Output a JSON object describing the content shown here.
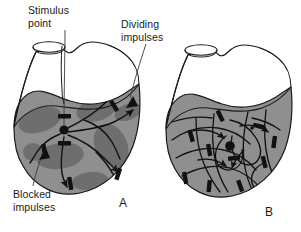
{
  "figure": {
    "background_color": "#ffffff"
  },
  "labels": {
    "stimulus_point": "Stimulus\npoint",
    "dividing_impulses": "Dividing\nimpulses",
    "blocked_impulses": "Blocked\nimpulses"
  },
  "captions": {
    "panel_a": "A",
    "panel_b": "B"
  },
  "colors": {
    "outline": "#1a1a1a",
    "atrium_fill": "#ffffff",
    "ventricle_fill": "#8f8f8f",
    "ischemic_patch_fill": "#6e6e6e",
    "impulse_path": "#1a1a1a",
    "block_bar": "#111111",
    "stimulus_dot": "#111111",
    "leader_line": "#3a3a3a"
  },
  "panels": [
    {
      "id": "A",
      "name": "panel-a-heart",
      "description": "Heart with patchy ischemic myocardium; a stimulus point gives rise to dividing impulses, several of which are blocked by areas of conduction block.",
      "stimulus_point": {
        "x": 64,
        "y": 131
      },
      "block_bar_count": 6,
      "impulse_arrow_count": 6,
      "ischemic_patch_count": 7
    },
    {
      "id": "B",
      "name": "panel-b-heart",
      "description": "Heart with diffusely damaged myocardium showing many tangled reentrant circuits and numerous conduction blocks.",
      "stimulus_point": {
        "x": 232,
        "y": 138
      },
      "block_bar_count": 10,
      "impulse_arrow_count": 4,
      "ischemic_patch_count": 0
    }
  ]
}
